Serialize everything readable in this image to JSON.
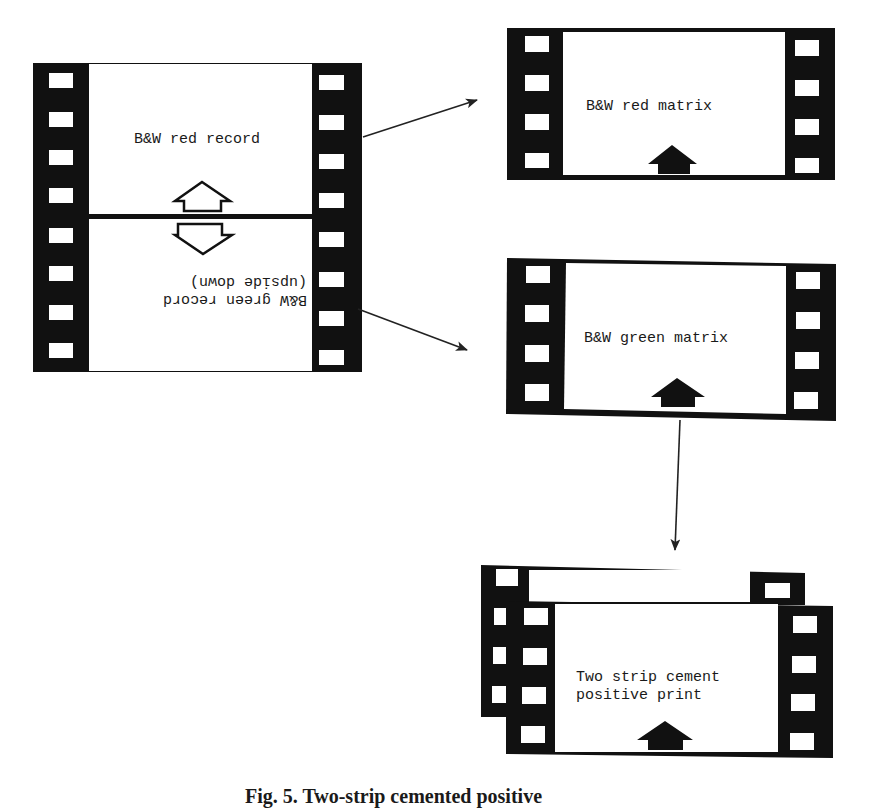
{
  "diagram": {
    "colors": {
      "ink": "#111111",
      "paper": "#ffffff"
    },
    "camera_negative": {
      "top_frame_label": "B&W red record",
      "bottom_frame_label_line1": "(upside down)",
      "bottom_frame_label_line2": "B&W green record",
      "top_frame_arrow": "hollow-up-arrow",
      "bottom_frame_arrow": "hollow-down-arrow",
      "sprocket_holes_per_side": 8
    },
    "red_matrix": {
      "label": "B&W red matrix",
      "arrow": "solid-up-arrow",
      "sprocket_holes_per_side": 4
    },
    "green_matrix": {
      "label": "B&W green matrix",
      "arrow": "solid-up-arrow",
      "sprocket_holes_per_side": 4
    },
    "positive_print": {
      "label_line1": "Two strip cement",
      "label_line2": "positive print",
      "arrow": "solid-up-arrow"
    },
    "connectors": [
      {
        "from": "camera_negative.top_frame",
        "to": "red_matrix"
      },
      {
        "from": "camera_negative.bottom_frame",
        "to": "green_matrix"
      },
      {
        "from": "green_matrix",
        "to": "positive_print"
      }
    ],
    "caption": "Fig. 5. Two-strip cemented positive"
  }
}
